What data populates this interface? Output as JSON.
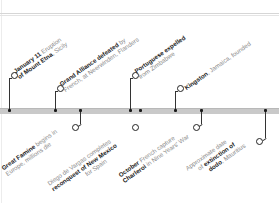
{
  "timeline": {
    "axis_color": "#c9c9c9",
    "marker_color": "#222222",
    "events_above": [
      {
        "bold": "January 11",
        "text": " Eruption",
        "line2_bold": "of Mount Etna",
        "line2": ", Sicily"
      },
      {
        "bold": "Grand Alliance defeated",
        "text": " by",
        "line2_bold": "",
        "line2": "French, at Neerwinden, Flanders"
      },
      {
        "bold": "Portuguese expelled",
        "text": "",
        "line2_bold": "",
        "line2": "from Zimbabwe"
      },
      {
        "bold": "Kingston",
        "text": ", Jamaica, founded",
        "line2_bold": "",
        "line2": ""
      }
    ],
    "events_below": [
      {
        "bold": "Great Famine",
        "text": " begins in",
        "line2_bold": "",
        "line2": "Europe, millions die"
      },
      {
        "pre": "Diego de Vargas completes",
        "bold": "reconquest of New Mexico",
        "line3": "for Spain"
      },
      {
        "bold": "October",
        "text": " French capture",
        "line2_bold": "Charleroi",
        "line2": " in Nine Years' War"
      },
      {
        "pre": "Approximate date",
        "mid_pre": "of ",
        "bold": "extinction of",
        "line3_bold": "dodo",
        "line3": ", Mauritius"
      }
    ]
  }
}
